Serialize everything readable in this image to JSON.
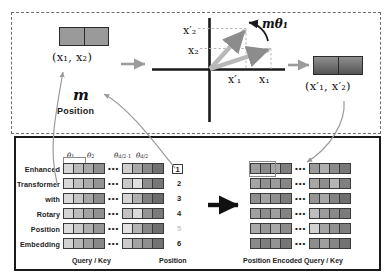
{
  "figure": {
    "top_panel": {
      "input_vector_label": "(x₁, x₂)",
      "output_vector_label": "(x′₁, x′₂)",
      "m_symbol": "m",
      "m_caption": "Position",
      "axis_labels": {
        "y_rotated": "x′₂",
        "y_original": "x₂",
        "x_rotated": "x′₁",
        "x_original": "x₁"
      },
      "rotation_angle_label": "mθ₁"
    },
    "bottom_panel": {
      "tokens": [
        "Enhanced",
        "Transformer",
        "with",
        "Rotary",
        "Position",
        "Embedding"
      ],
      "positions": [
        "1",
        "2",
        "3",
        "4",
        "5",
        "6"
      ],
      "highlighted_position": "1",
      "theta_labels": [
        "θ₁",
        "θ₂",
        "θ_{d/2-1}",
        "θ_{d/2}"
      ],
      "theta_1": "θ",
      "theta_1_sub": "1",
      "theta_2": "θ",
      "theta_2_sub": "2",
      "theta_3": "θ",
      "theta_3_sub": "d/2-1",
      "theta_4": "θ",
      "theta_4_sub": "d/2",
      "ellipsis": "•••",
      "caption_left": "Query / Key",
      "caption_middle": "Position",
      "caption_right": "Position Encoded Query / Key"
    }
  },
  "chart_data": {
    "type": "diagram",
    "grids": {
      "query_key": {
        "rows": 6,
        "left_block_cells": 4,
        "right_block_cells": 4,
        "left_shades": [
          [
            "#d6d6d6",
            "#b9b9b9",
            "#a8a8a8",
            "#8f8f8f"
          ],
          [
            "#d8d8d8",
            "#c0c0c0",
            "#ababab",
            "#949494"
          ],
          [
            "#dadada",
            "#c4c4c4",
            "#a5a5a5",
            "#8b8b8b"
          ],
          [
            "#d4d4d4",
            "#bcbcbc",
            "#a2a2a2",
            "#909090"
          ],
          [
            "#dcdcdc",
            "#c8c8c8",
            "#aeaeae",
            "#969696"
          ],
          [
            "#d2d2d2",
            "#b6b6b6",
            "#9e9e9e",
            "#888888"
          ]
        ],
        "right_shades": [
          [
            "#cfcfcf",
            "#a9a9a9",
            "#8a8a8a",
            "#707070"
          ],
          [
            "#c9c9c9",
            "#e0e0e0",
            "#8d8d8d",
            "#767676"
          ],
          [
            "#d5d5d5",
            "#b0b0b0",
            "#7f7f7f",
            "#6b6b6b"
          ],
          [
            "#c2c2c2",
            "#dadada",
            "#949494",
            "#7a7a7a"
          ],
          [
            "#e2e2e2",
            "#b4b4b4",
            "#868686",
            "#6e6e6e"
          ],
          [
            "#cbcbcb",
            "#a3a3a3",
            "#8f8f8f",
            "#737373"
          ]
        ]
      },
      "encoded_query_key": {
        "rows": 6,
        "left_block_cells": 4,
        "right_block_cells": 4,
        "left_shades": [
          [
            "#9d9d9d",
            "#8b8b8b",
            "#a6a6a6",
            "#7e7e7e"
          ],
          [
            "#a5a5a5",
            "#929292",
            "#9b9b9b",
            "#868686"
          ],
          [
            "#8f8f8f",
            "#a3a3a3",
            "#909090",
            "#7c7c7c"
          ],
          [
            "#a0a0a0",
            "#8d8d8d",
            "#9f9f9f",
            "#838383"
          ],
          [
            "#aaaaaa",
            "#989898",
            "#a9a9a9",
            "#8c8c8c"
          ],
          [
            "#8a8a8a",
            "#7e7e7e",
            "#949494",
            "#767676"
          ]
        ],
        "right_shades": [
          [
            "#9a9a9a",
            "#b0b0b0",
            "#8b8b8b",
            "#777777"
          ],
          [
            "#a7a7a7",
            "#8e8e8e",
            "#b5b5b5",
            "#808080"
          ],
          [
            "#949494",
            "#a8a8a8",
            "#838383",
            "#6f6f6f"
          ],
          [
            "#bdbdbd",
            "#9c9c9c",
            "#8a8a8a",
            "#7b7b7b"
          ],
          [
            "#d2d2d2",
            "#a5a5a5",
            "#919191",
            "#7d7d7d"
          ],
          [
            "#8d8d8d",
            "#9f9f9f",
            "#868686",
            "#727272"
          ]
        ]
      }
    },
    "colors": {
      "panel_border_top": "#6d6d6d",
      "panel_border_bottom": "#1a1a1a",
      "vector_arrow": "#a0a0a0",
      "axis": "#1a1a1a",
      "curved_arrow": "#8c8c8c",
      "block_arrow": "#111111"
    }
  }
}
